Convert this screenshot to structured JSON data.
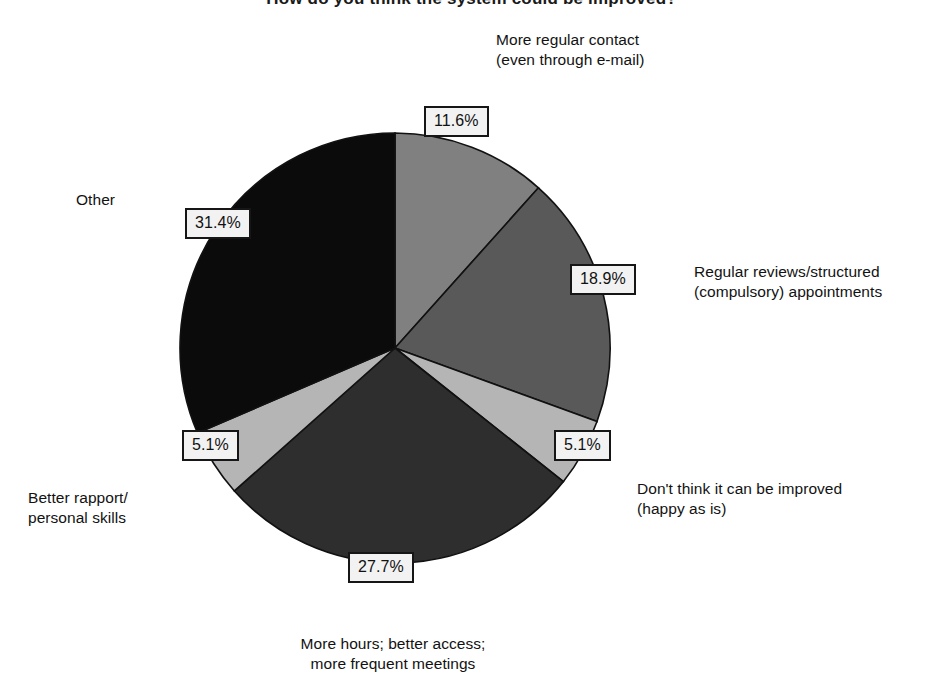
{
  "chart_data": {
    "type": "pie",
    "title": "How do you think the system could be improved?",
    "categories": [
      "More regular contact (even through e-mail)",
      "Regular reviews/structured (compulsory) appointments",
      "Don't think it can be improved (happy as is)",
      "More hours; better access; more frequent meetings",
      "Better rapport/personal skills",
      "Other"
    ],
    "values": [
      11.6,
      18.9,
      5.1,
      27.7,
      5.1,
      31.4
    ],
    "value_labels": [
      "11.6%",
      "18.9%",
      "5.1%",
      "27.7%",
      "5.1%",
      "31.4%"
    ],
    "colors": [
      "#808080",
      "#595959",
      "#b5b5b5",
      "#2e2e2e",
      "#b5b5b5",
      "#0b0b0b"
    ],
    "slice_outline": "#111111",
    "start_angle_deg": 0,
    "direction": "clockwise",
    "legend": "none",
    "grid": false,
    "xlabel": "",
    "ylabel": ""
  },
  "labels": {
    "more_regular_contact": "More regular contact\n(even through e-mail)",
    "regular_reviews": "Regular reviews/structured\n(compulsory) appointments",
    "not_improved": "Don't think it can be improved\n(happy as is)",
    "more_hours": "More hours; better access;\nmore frequent meetings",
    "better_rapport": "Better rapport/\npersonal skills",
    "other": "Other"
  },
  "values": {
    "more_regular_contact": "11.6%",
    "regular_reviews": "18.9%",
    "not_improved": "5.1%",
    "more_hours": "27.7%",
    "better_rapport": "5.1%",
    "other": "31.4%"
  }
}
